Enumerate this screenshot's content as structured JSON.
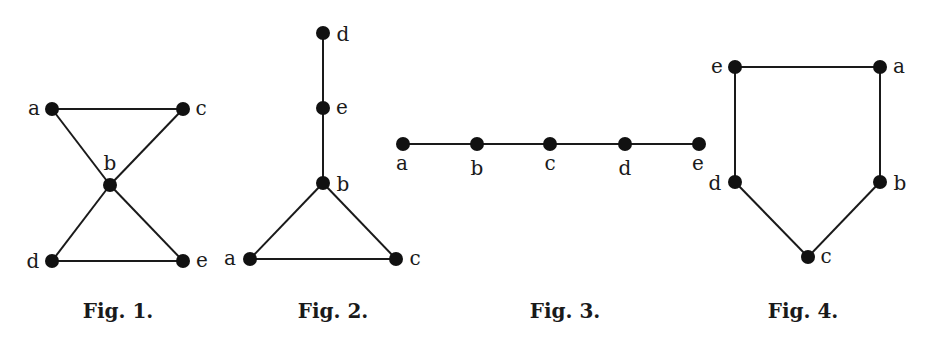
{
  "figures": [
    {
      "id": "fig1",
      "caption": "Fig. 1.",
      "caption_pos": [
        118,
        318
      ],
      "nodes": [
        {
          "name": "a",
          "x": 52,
          "y": 109,
          "lx": 34,
          "ly": 115,
          "anchor": "middle"
        },
        {
          "name": "c",
          "x": 183,
          "y": 109,
          "lx": 201,
          "ly": 115,
          "anchor": "middle"
        },
        {
          "name": "b",
          "x": 110,
          "y": 185,
          "lx": 110,
          "ly": 170,
          "anchor": "middle"
        },
        {
          "name": "d",
          "x": 52,
          "y": 261,
          "lx": 33,
          "ly": 268,
          "anchor": "middle"
        },
        {
          "name": "e",
          "x": 183,
          "y": 261,
          "lx": 202,
          "ly": 267,
          "anchor": "middle"
        }
      ],
      "edges": [
        [
          "a",
          "c"
        ],
        [
          "a",
          "b"
        ],
        [
          "c",
          "b"
        ],
        [
          "b",
          "d"
        ],
        [
          "b",
          "e"
        ],
        [
          "d",
          "e"
        ]
      ]
    },
    {
      "id": "fig2",
      "caption": "Fig. 2.",
      "caption_pos": [
        333,
        318
      ],
      "nodes": [
        {
          "name": "d",
          "x": 323,
          "y": 33,
          "lx": 343,
          "ly": 41,
          "anchor": "middle"
        },
        {
          "name": "e",
          "x": 323,
          "y": 108,
          "lx": 342,
          "ly": 114,
          "anchor": "middle"
        },
        {
          "name": "b",
          "x": 323,
          "y": 183,
          "lx": 343,
          "ly": 191,
          "anchor": "middle"
        },
        {
          "name": "a",
          "x": 250,
          "y": 259,
          "lx": 230,
          "ly": 265,
          "anchor": "middle"
        },
        {
          "name": "c",
          "x": 396,
          "y": 259,
          "lx": 415,
          "ly": 265,
          "anchor": "middle"
        }
      ],
      "edges": [
        [
          "d",
          "e"
        ],
        [
          "e",
          "b"
        ],
        [
          "b",
          "a"
        ],
        [
          "b",
          "c"
        ],
        [
          "a",
          "c"
        ]
      ]
    },
    {
      "id": "fig3",
      "caption": "Fig. 3.",
      "caption_pos": [
        565,
        318
      ],
      "nodes": [
        {
          "name": "a",
          "x": 403,
          "y": 144,
          "lx": 402,
          "ly": 170,
          "anchor": "middle"
        },
        {
          "name": "b",
          "x": 477,
          "y": 144,
          "lx": 477,
          "ly": 175,
          "anchor": "middle"
        },
        {
          "name": "c",
          "x": 550,
          "y": 144,
          "lx": 550,
          "ly": 170,
          "anchor": "middle"
        },
        {
          "name": "d",
          "x": 625,
          "y": 144,
          "lx": 625,
          "ly": 175,
          "anchor": "middle"
        },
        {
          "name": "e",
          "x": 699,
          "y": 144,
          "lx": 698,
          "ly": 170,
          "anchor": "middle"
        }
      ],
      "edges": [
        [
          "a",
          "b"
        ],
        [
          "b",
          "c"
        ],
        [
          "c",
          "d"
        ],
        [
          "d",
          "e"
        ]
      ]
    },
    {
      "id": "fig4",
      "caption": "Fig. 4.",
      "caption_pos": [
        803,
        318
      ],
      "nodes": [
        {
          "name": "e",
          "x": 735,
          "y": 67,
          "lx": 717,
          "ly": 73,
          "anchor": "middle"
        },
        {
          "name": "a",
          "x": 880,
          "y": 67,
          "lx": 899,
          "ly": 73,
          "anchor": "middle"
        },
        {
          "name": "d",
          "x": 735,
          "y": 182,
          "lx": 715,
          "ly": 190,
          "anchor": "middle"
        },
        {
          "name": "b",
          "x": 880,
          "y": 182,
          "lx": 900,
          "ly": 190,
          "anchor": "middle"
        },
        {
          "name": "c",
          "x": 808,
          "y": 257,
          "lx": 826,
          "ly": 263,
          "anchor": "middle"
        }
      ],
      "edges": [
        [
          "e",
          "a"
        ],
        [
          "e",
          "d"
        ],
        [
          "a",
          "b"
        ],
        [
          "d",
          "c"
        ],
        [
          "b",
          "c"
        ]
      ]
    }
  ],
  "style": {
    "node_radius": 7,
    "edge_color": "#1a1a1a",
    "node_color": "#111111",
    "background": "#ffffff"
  }
}
